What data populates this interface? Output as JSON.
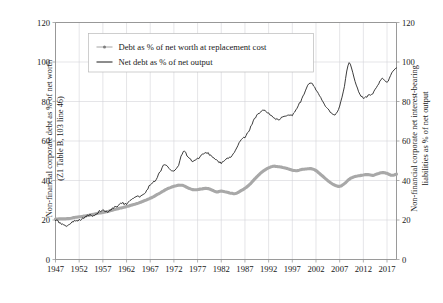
{
  "chart_data": {
    "type": "line",
    "title": "",
    "xlabel": "",
    "ylabel": "Non-financial corporate debt as % of net worth (Z1 Table B, 103 line 46)",
    "y2label": "Non-financial corporate net interest-bearing liabilities as % of net output",
    "grid": true,
    "legend_position": "top-left-inside",
    "xlim": [
      1947,
      2019
    ],
    "ylim": [
      0,
      120
    ],
    "y2lim": [
      0,
      120
    ],
    "yticks": [
      0,
      20,
      40,
      60,
      80,
      100,
      120
    ],
    "y2ticks": [
      0,
      20,
      40,
      60,
      80,
      100,
      120
    ],
    "xticks": [
      1947,
      1952,
      1957,
      1962,
      1967,
      1972,
      1977,
      1982,
      1987,
      1992,
      1997,
      2002,
      2007,
      2012,
      2017
    ],
    "series": [
      {
        "name": "Debt as % of net worth at replacement cost",
        "axis": "left",
        "color": "#a8a8a8",
        "style": "thick-gray",
        "x": [
          1947,
          1948,
          1949,
          1950,
          1951,
          1952,
          1953,
          1954,
          1955,
          1956,
          1957,
          1958,
          1959,
          1960,
          1961,
          1962,
          1963,
          1964,
          1965,
          1966,
          1967,
          1968,
          1969,
          1970,
          1971,
          1972,
          1973,
          1974,
          1975,
          1976,
          1977,
          1978,
          1979,
          1980,
          1981,
          1982,
          1983,
          1984,
          1985,
          1986,
          1987,
          1988,
          1989,
          1990,
          1991,
          1992,
          1993,
          1994,
          1995,
          1996,
          1997,
          1998,
          1999,
          2000,
          2001,
          2002,
          2003,
          2004,
          2005,
          2006,
          2007,
          2008,
          2009,
          2010,
          2011,
          2012,
          2013,
          2014,
          2015,
          2016,
          2017,
          2018,
          2019
        ],
        "values": [
          20.5,
          20.6,
          20.6,
          20.8,
          21.3,
          21.6,
          22.0,
          22.4,
          22.9,
          23.4,
          23.8,
          24.3,
          25.0,
          25.6,
          26.2,
          26.8,
          27.5,
          28.2,
          29.0,
          30.0,
          31.0,
          32.2,
          33.6,
          35.0,
          36.2,
          37.0,
          37.6,
          37.4,
          36.2,
          35.4,
          35.4,
          35.8,
          36.0,
          35.2,
          34.2,
          34.6,
          34.2,
          33.6,
          33.4,
          34.6,
          36.0,
          38.0,
          40.6,
          43.0,
          45.0,
          46.4,
          47.2,
          47.0,
          46.6,
          46.0,
          45.2,
          45.0,
          45.6,
          45.8,
          46.0,
          45.0,
          43.0,
          41.0,
          39.0,
          37.6,
          37.0,
          38.4,
          40.6,
          41.8,
          42.4,
          42.8,
          43.0,
          42.6,
          43.4,
          44.0,
          43.6,
          42.6,
          43.2
        ]
      },
      {
        "name": "Net debt as % of net output",
        "axis": "right",
        "color": "#1a1a1a",
        "style": "thin-black",
        "x": [
          1947,
          1948,
          1949,
          1950,
          1951,
          1952,
          1953,
          1954,
          1955,
          1956,
          1957,
          1958,
          1959,
          1960,
          1961,
          1962,
          1963,
          1964,
          1965,
          1966,
          1967,
          1968,
          1969,
          1970,
          1971,
          1972,
          1973,
          1974,
          1975,
          1976,
          1977,
          1978,
          1979,
          1980,
          1981,
          1982,
          1983,
          1984,
          1985,
          1986,
          1987,
          1988,
          1989,
          1990,
          1991,
          1992,
          1993,
          1994,
          1995,
          1996,
          1997,
          1998,
          1999,
          2000,
          2001,
          2002,
          2003,
          2004,
          2005,
          2006,
          2007,
          2008,
          2009,
          2010,
          2011,
          2012,
          2013,
          2014,
          2015,
          2016,
          2017,
          2018,
          2019
        ],
        "values": [
          20.0,
          18.5,
          17.0,
          18.0,
          19.5,
          20.0,
          21.0,
          22.5,
          22.0,
          24.0,
          25.0,
          24.0,
          26.0,
          27.0,
          28.5,
          28.0,
          30.0,
          31.5,
          32.0,
          34.0,
          38.0,
          40.0,
          44.0,
          48.0,
          46.0,
          45.0,
          48.0,
          55.0,
          52.0,
          50.0,
          51.0,
          53.0,
          54.0,
          52.0,
          50.0,
          49.0,
          51.0,
          52.0,
          55.0,
          60.0,
          62.0,
          66.0,
          71.0,
          74.0,
          76.0,
          74.0,
          72.0,
          71.0,
          72.0,
          73.0,
          73.0,
          77.0,
          81.0,
          87.0,
          89.0,
          86.0,
          82.0,
          78.0,
          75.0,
          73.0,
          78.0,
          88.0,
          100.0,
          92.0,
          85.0,
          82.0,
          83.0,
          84.0,
          88.0,
          92.0,
          90.0,
          94.0,
          97.0
        ]
      }
    ],
    "annotations": []
  },
  "legend": {
    "items": [
      {
        "label": "Debt as % of net worth at replacement cost",
        "marker": "line-with-dot-marker"
      },
      {
        "label": "Net debt as % of net output",
        "marker": "plain-line"
      }
    ]
  },
  "axes": {
    "left_title_line1": "Non-financial corporate debt as % of net worth",
    "left_title_line2": "(Z1  Table B, 103 line 46)",
    "right_title_line1": "Non-financial corporate net interest-bearing",
    "right_title_line2": "liabilities as % of net output"
  }
}
